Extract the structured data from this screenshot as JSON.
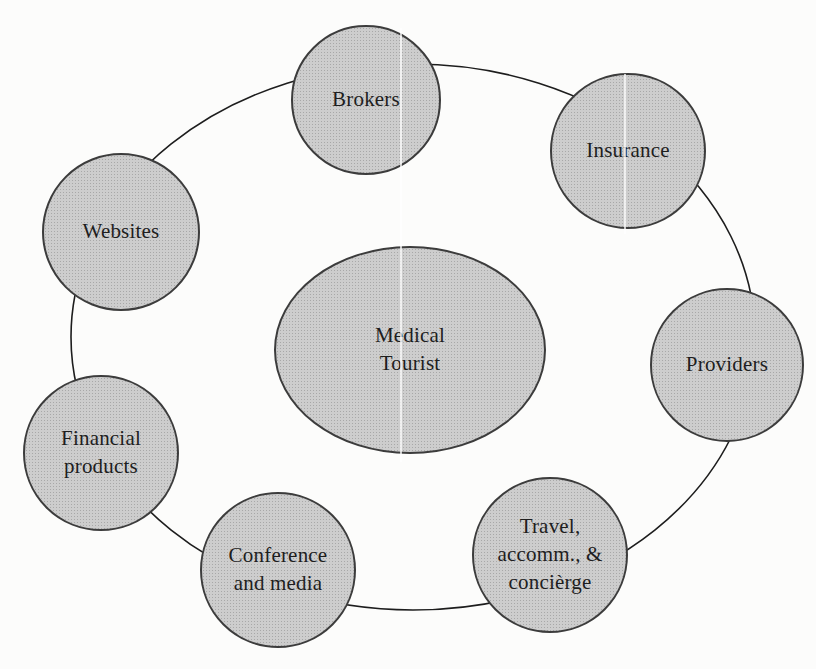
{
  "diagram": {
    "type": "hub-ring-network",
    "center": {
      "id": "medical-tourist",
      "label": "Medical\nTourist"
    },
    "nodes": [
      {
        "id": "brokers",
        "label": "Brokers"
      },
      {
        "id": "insurance",
        "label": "Insurance"
      },
      {
        "id": "providers",
        "label": "Providers"
      },
      {
        "id": "travel",
        "label": "Travel,\naccomm., &\nconcièrge"
      },
      {
        "id": "conference",
        "label": "Conference\nand media"
      },
      {
        "id": "financial",
        "label": "Financial\nproducts"
      },
      {
        "id": "websites",
        "label": "Websites"
      }
    ],
    "relations": {
      "hub": "Medical Tourist",
      "ring_members": [
        "Brokers",
        "Insurance",
        "Providers",
        "Travel, accomm., & concièrge",
        "Conference and media",
        "Financial products",
        "Websites"
      ]
    },
    "colors": {
      "node_fill": "#c8c8c8",
      "node_halftone_dot": "#a8a8a8",
      "node_border": "#3c3c3c",
      "ring_stroke": "#1d1d1d",
      "text": "#1e1e1e",
      "background": "#fcfcfb"
    }
  }
}
